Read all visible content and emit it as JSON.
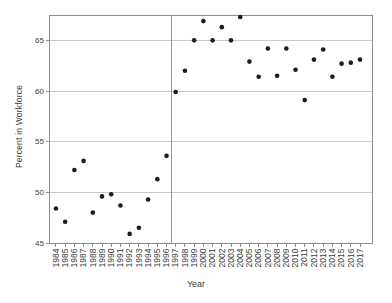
{
  "chart_data": {
    "type": "scatter",
    "title": "",
    "xlabel": "Year",
    "ylabel": "Percent in Workforce",
    "x": [
      1984,
      1985,
      1986,
      1987,
      1988,
      1989,
      1990,
      1991,
      1992,
      1993,
      1994,
      1995,
      1996,
      1997,
      1998,
      1999,
      2000,
      2001,
      2002,
      2003,
      2004,
      2005,
      2006,
      2007,
      2008,
      2009,
      2010,
      2011,
      2012,
      2013,
      2014,
      2015,
      2016,
      2017
    ],
    "y": [
      48.4,
      47.1,
      52.2,
      53.1,
      48.0,
      49.6,
      49.8,
      48.7,
      45.9,
      46.5,
      49.3,
      51.3,
      53.6,
      59.9,
      62.0,
      65.0,
      66.9,
      65.0,
      66.3,
      65.0,
      67.3,
      62.9,
      61.4,
      64.2,
      61.5,
      64.2,
      62.1,
      59.1,
      63.1,
      64.1,
      61.4,
      62.7,
      62.8,
      63.1
    ],
    "yticks": [
      45,
      50,
      55,
      60,
      65
    ],
    "ytick_labels": [
      "45",
      "50",
      "55",
      "60",
      "65"
    ],
    "xlim": [
      1983.3,
      2018.3
    ],
    "ylim": [
      45,
      67.5
    ],
    "reference_line_x": 1996.5,
    "grid": "horizontal",
    "legend": "none",
    "colors": {
      "point": "#1c1c1c",
      "frame": "#8e8e8e",
      "gridline": "#cacaca",
      "reference_line": "#979797",
      "text": "#3c3c3c",
      "background": "#ffffff"
    }
  }
}
